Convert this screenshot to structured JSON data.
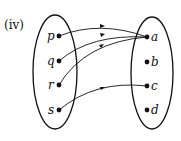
{
  "figure": {
    "label": "(iv)",
    "domain_set": {
      "elements": [
        {
          "name": "p",
          "x": 59,
          "y": 36
        },
        {
          "name": "q",
          "x": 59,
          "y": 61
        },
        {
          "name": "r",
          "x": 59,
          "y": 85
        },
        {
          "name": "s",
          "x": 59,
          "y": 110
        }
      ]
    },
    "codomain_set": {
      "elements": [
        {
          "name": "a",
          "x": 147,
          "y": 37
        },
        {
          "name": "b",
          "x": 147,
          "y": 62
        },
        {
          "name": "c",
          "x": 147,
          "y": 86
        },
        {
          "name": "d",
          "x": 147,
          "y": 110
        }
      ]
    },
    "mappings": [
      {
        "from": "p",
        "to": "a"
      },
      {
        "from": "q",
        "to": "a"
      },
      {
        "from": "r",
        "to": "a"
      },
      {
        "from": "s",
        "to": "c"
      }
    ],
    "colors": {
      "stroke": "#111111",
      "background": "#ffffff"
    }
  }
}
